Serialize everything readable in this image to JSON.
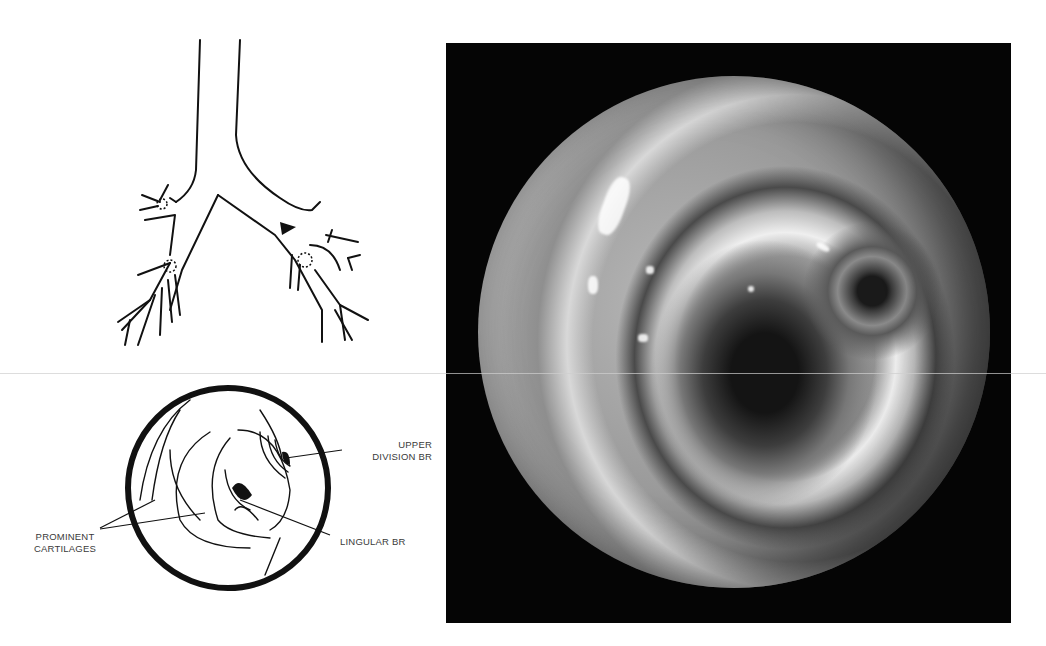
{
  "figure": {
    "panel_top_left": {
      "type": "line-drawing",
      "subject": "bronchial-tree-diagram",
      "markers": [
        "arrow pointing to left upper lobe / lingular division",
        "dotted circles at segmental orifices"
      ]
    },
    "panel_bottom_left": {
      "type": "line-drawing",
      "subject": "endoscopic-view-schematic",
      "labels": {
        "upper_division_line1": "UPPER",
        "upper_division_line2": "DIVISION BR",
        "lingular": "LINGULAR BR",
        "cartilages_line1": "PROMINENT",
        "cartilages_line2": "CARTILAGES"
      }
    },
    "panel_right": {
      "type": "photograph",
      "subject": "bronchoscopic-view",
      "background_color": "#050505"
    }
  },
  "colors": {
    "ink": "#111111",
    "label_text": "#3a3a3a",
    "page": "#ffffff"
  }
}
